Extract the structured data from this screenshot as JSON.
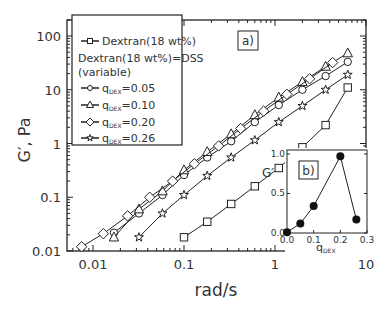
{
  "chart_data": [
    {
      "panel": "a)",
      "type": "line",
      "xscale": "log",
      "yscale": "log",
      "xlabel": "rad/s",
      "ylabel": "G′, Pa",
      "xlim": [
        0.0052,
        10
      ],
      "ylim": [
        0.01,
        200
      ],
      "xticks": [
        "0.01",
        "0.1",
        "1",
        "10"
      ],
      "yticks": [
        "0.01",
        "0.1",
        "1",
        "10",
        "100"
      ],
      "legend": {
        "position": "upper left",
        "entries": [
          {
            "marker": "square",
            "label": "Dextran(18 wt%)"
          },
          {
            "marker": "none",
            "label": "Dextran(18 wt%)=DSS"
          },
          {
            "marker": "none",
            "label": "(variable)"
          },
          {
            "marker": "circle",
            "label": "q",
            "sub": "DEX",
            "suffix": "=0.05"
          },
          {
            "marker": "triangle",
            "label": "q",
            "sub": "DEX",
            "suffix": "=0.10"
          },
          {
            "marker": "diamond",
            "label": "q",
            "sub": "DEX",
            "suffix": "=0.20"
          },
          {
            "marker": "star",
            "label": "q",
            "sub": "DEX",
            "suffix": "=0.26"
          }
        ]
      },
      "series": [
        {
          "name": "Dextran(18 wt%)",
          "marker": "square",
          "x": [
            0.1,
            0.18,
            0.33,
            0.6,
            1.1,
            2.0,
            3.6,
            6.3
          ],
          "y": [
            0.018,
            0.035,
            0.075,
            0.16,
            0.35,
            0.85,
            2.2,
            11
          ]
        },
        {
          "name": "qDEX=0.05",
          "marker": "circle",
          "x": [
            0.017,
            0.032,
            0.058,
            0.1,
            0.18,
            0.33,
            0.6,
            1.1,
            2.0,
            3.6,
            6.3
          ],
          "y": [
            0.022,
            0.05,
            0.11,
            0.26,
            0.55,
            1.1,
            2.5,
            5.2,
            10,
            18,
            33
          ]
        },
        {
          "name": "qDEX=0.10",
          "marker": "triangle",
          "x": [
            0.017,
            0.032,
            0.058,
            0.1,
            0.18,
            0.33,
            0.6,
            1.1,
            2.0,
            3.6,
            6.3
          ],
          "y": [
            0.018,
            0.06,
            0.13,
            0.32,
            0.7,
            1.5,
            3.4,
            7.2,
            14,
            27,
            48
          ]
        },
        {
          "name": "qDEX=0.20",
          "marker": "diamond",
          "x": [
            0.0075,
            0.013,
            0.024,
            0.042,
            0.075,
            0.13,
            0.24,
            0.42,
            0.75,
            1.35,
            2.4,
            4.3
          ],
          "y": [
            0.012,
            0.021,
            0.045,
            0.1,
            0.2,
            0.42,
            0.9,
            1.9,
            4.0,
            8.2,
            16,
            32
          ]
        },
        {
          "name": "qDEX=0.26",
          "marker": "star",
          "x": [
            0.032,
            0.058,
            0.1,
            0.18,
            0.33,
            0.6,
            1.1,
            2.0,
            3.6,
            6.3
          ],
          "y": [
            0.018,
            0.05,
            0.11,
            0.25,
            0.55,
            1.15,
            2.5,
            5.0,
            10,
            19
          ]
        }
      ]
    },
    {
      "panel": "b)",
      "type": "line",
      "inset": true,
      "xlabel": "q",
      "xlabel_sub": "DEX",
      "ylabel": "G′",
      "xlim": [
        0,
        0.3
      ],
      "ylim": [
        0,
        1.05
      ],
      "xticks": [
        "0.0",
        "0.1",
        "0.2",
        "0.3"
      ],
      "yticks": [
        "0.0",
        "0.5",
        "1.0"
      ],
      "series": [
        {
          "name": "G′ vs qDEX",
          "marker": "filled-circle",
          "x": [
            0.0,
            0.05,
            0.1,
            0.2,
            0.26
          ],
          "y": [
            0.01,
            0.12,
            0.34,
            0.97,
            0.17
          ]
        }
      ]
    }
  ]
}
